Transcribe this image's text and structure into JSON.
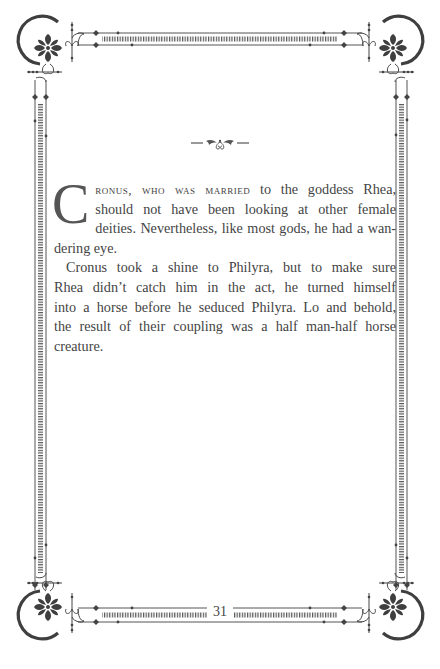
{
  "page": {
    "number": "31",
    "colors": {
      "ink": "#444444",
      "border": "#4a4a4a",
      "background": "#ffffff"
    }
  },
  "ornaments": {
    "top_divider": "scroll-ornament-icon",
    "corners": [
      "corner-flourish-top-left-icon",
      "corner-flourish-top-right-icon",
      "corner-flourish-bottom-left-icon",
      "corner-flourish-bottom-right-icon"
    ]
  },
  "content": {
    "dropcap": "C",
    "smallcaps_lead": "ronus, who was married",
    "paragraph1_lines": [
      " to the goddess Rhea,",
      "should not have been looking at other female",
      "deities. Nevertheless, like most gods, he had a wan-",
      "dering eye."
    ],
    "paragraph2_lines": [
      "Cronus took a shine to Philyra, but to make sure",
      "Rhea didn’t catch him in the act, he turned himself",
      "into a horse before he seduced Philyra. Lo and behold,",
      "the result of their coupling was a half man-half horse",
      "creature."
    ]
  }
}
